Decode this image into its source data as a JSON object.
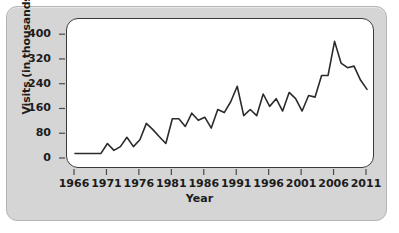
{
  "chart_data": {
    "type": "line",
    "title": "",
    "xlabel": "Year",
    "ylabel": "Visits (in thousands)",
    "xlim": [
      1966,
      2011
    ],
    "ylim": [
      0,
      420
    ],
    "grid": false,
    "legend": null,
    "y_ticks": [
      0,
      80,
      160,
      240,
      320,
      400
    ],
    "y_tick_labels": [
      "0",
      "80",
      "160",
      "240",
      "320",
      "400"
    ],
    "x_ticks": [
      1966,
      1971,
      1976,
      1981,
      1986,
      1991,
      1996,
      2001,
      2006,
      2011
    ],
    "x_tick_labels": [
      "1966",
      "1971",
      "1976",
      "1981",
      "1986",
      "1991",
      "1996",
      "2001",
      "2006",
      "2011"
    ],
    "x_minor_ticks": [
      1966,
      1971,
      1976,
      1981,
      1986,
      1991,
      1996,
      2001,
      2006,
      2011
    ],
    "line_color": "#2b2b2b",
    "line_width": 1.6,
    "plot_background": "#ffffff",
    "panel_background": "#d5d5d5",
    "x": [
      1966,
      1967,
      1968,
      1969,
      1970,
      1971,
      1972,
      1973,
      1974,
      1975,
      1976,
      1977,
      1978,
      1979,
      1980,
      1981,
      1982,
      1983,
      1984,
      1985,
      1986,
      1987,
      1988,
      1989,
      1990,
      1991,
      1992,
      1993,
      1994,
      1995,
      1996,
      1997,
      1998,
      1999,
      2000,
      2001,
      2002,
      2003,
      2004,
      2005,
      2006,
      2007,
      2008,
      2009,
      2010,
      2011
    ],
    "values": [
      18,
      18,
      18,
      18,
      18,
      50,
      28,
      40,
      70,
      40,
      62,
      115,
      95,
      72,
      50,
      130,
      130,
      105,
      148,
      125,
      135,
      100,
      160,
      150,
      185,
      235,
      140,
      160,
      140,
      210,
      170,
      195,
      155,
      215,
      195,
      155,
      205,
      200,
      270,
      270,
      380,
      310,
      295,
      300,
      255,
      225
    ],
    "series": [
      {
        "name": "Visits",
        "values": [
          18,
          18,
          18,
          18,
          18,
          50,
          28,
          40,
          70,
          40,
          62,
          115,
          95,
          72,
          50,
          130,
          130,
          105,
          148,
          125,
          135,
          100,
          160,
          150,
          185,
          235,
          140,
          160,
          140,
          210,
          170,
          195,
          155,
          215,
          195,
          155,
          205,
          200,
          270,
          270,
          380,
          310,
          295,
          300,
          255,
          225
        ]
      }
    ]
  }
}
